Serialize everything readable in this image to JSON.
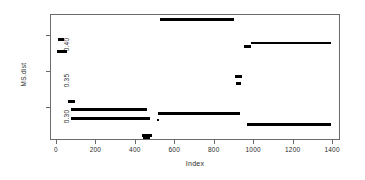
{
  "figure": {
    "background": "#ffffff",
    "frame_color": "#6b6b6b",
    "point_color": "#000000"
  },
  "chart_data": {
    "type": "scatter",
    "title": "",
    "xlabel": "Index",
    "ylabel": "MS.dist",
    "xlim": [
      -30,
      1440
    ],
    "ylim": [
      0.262,
      0.433
    ],
    "grid": false,
    "legend": null,
    "xticks": [
      0,
      200,
      400,
      600,
      800,
      1000,
      1200,
      1400
    ],
    "xticklabels": [
      "0",
      "200",
      "400",
      "600",
      "800",
      "1000",
      "1200",
      "1400"
    ],
    "yticks": [
      0.3,
      0.35,
      0.4
    ],
    "yticklabels": [
      "0.30",
      "0.35",
      "0.40"
    ],
    "series": [
      {
        "name": "MS.dist",
        "segments": [
          {
            "x0": 8,
            "x1": 38,
            "y": 0.4,
            "note": "short plateau at 0.40 near start"
          },
          {
            "x0": 2,
            "x1": 52,
            "y": 0.3835,
            "note": "plateau just below 0.40"
          },
          {
            "x0": 55,
            "x1": 90,
            "y": 0.3155,
            "note": "short plateau"
          },
          {
            "x0": 70,
            "x1": 455,
            "y": 0.305,
            "note": "long plateau slightly above 0.30"
          },
          {
            "x0": 72,
            "x1": 470,
            "y": 0.2925,
            "note": "long plateau below 0.30"
          },
          {
            "x0": 430,
            "x1": 480,
            "y": 0.269,
            "note": "low outlier band"
          },
          {
            "x0": 438,
            "x1": 470,
            "y": 0.265,
            "note": "lowest band"
          },
          {
            "x0": 505,
            "x1": 520,
            "y": 0.2905,
            "note": "short step"
          },
          {
            "x0": 510,
            "x1": 930,
            "y": 0.2995,
            "note": "long plateau at ~0.30"
          },
          {
            "x0": 520,
            "x1": 900,
            "y": 0.427,
            "note": "top plateau, highest level"
          },
          {
            "x0": 905,
            "x1": 940,
            "y": 0.349,
            "note": "short plateau near 0.35"
          },
          {
            "x0": 908,
            "x1": 935,
            "y": 0.34,
            "note": "short plateau below 0.35"
          },
          {
            "x0": 950,
            "x1": 985,
            "y": 0.39,
            "note": "short step before long high band"
          },
          {
            "x0": 985,
            "x1": 1390,
            "y": 0.395,
            "note": "long plateau near 0.395"
          },
          {
            "x0": 965,
            "x1": 1390,
            "y": 0.2845,
            "note": "long low plateau"
          }
        ]
      }
    ]
  }
}
